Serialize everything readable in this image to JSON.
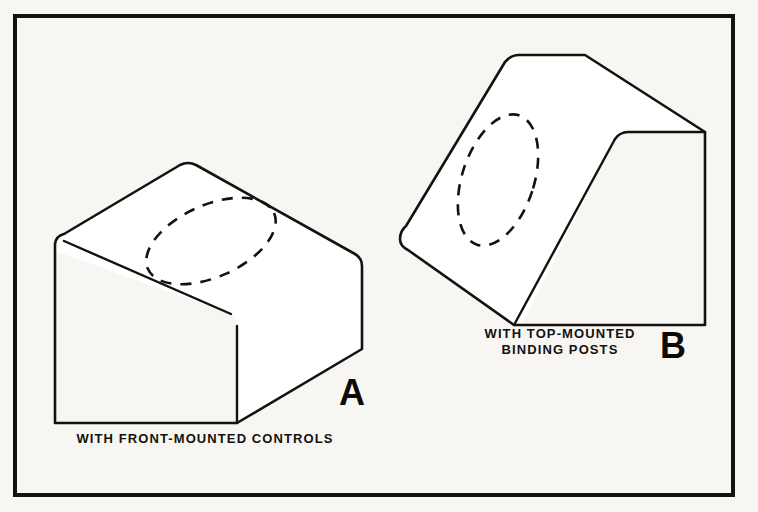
{
  "figure": {
    "background_color": "#f7f6f3",
    "ink_color": "#14120f",
    "frame": {
      "name": "illustration-border",
      "x": 13,
      "y": 14,
      "width": 722,
      "height": 483,
      "stroke_width": 4
    },
    "panels": [
      {
        "id": "A",
        "letter": "A",
        "letter_x": 352,
        "letter_y": 405,
        "letter_size": 36,
        "caption_lines": [
          "WITH FRONT-MOUNTED CONTROLS"
        ],
        "caption_x": 205,
        "caption_y": 443,
        "caption_size": 13,
        "caption_line_height": 15,
        "object_name": "chassis-box-front-mounted",
        "top_face": "M 55 251 L 55 244 Q 56 236 64 234 L 180 165 Q 188 161 196 165 L 355 254 Q 362 258 362 266 L 362 349 L 237 423 L 237 326 Q 237 318 231 314 Z",
        "outline": "M 55 251 L 55 244 Q 56 236 64 234 L 180 165 Q 188 161 196 165 L 355 254 Q 362 258 362 266 L 362 349 L 237 423 L 55 423 Z",
        "edge_top_left": "M 64 234 L 196 165",
        "edge_ridge": "M 64 241 L 231 314",
        "edge_front_right": "M 237 326 L 237 423",
        "edge_bottom": "M 55 423 L 237 423",
        "edge_left": "M 55 244 L 55 423",
        "edge_diag_lower": "M 237 423 L 362 349",
        "edge_right": "M 362 266 L 362 349",
        "edge_top_right": "M 196 165 L 355 254",
        "dashed_shape": {
          "name": "dashed-cutout-oval-a",
          "cx": 211,
          "cy": 241,
          "rx": 69,
          "ry": 36,
          "rotation": -24
        }
      },
      {
        "id": "B",
        "letter": "B",
        "letter_x": 673,
        "letter_y": 358,
        "letter_size": 36,
        "caption_lines": [
          "WITH TOP-MOUNTED",
          "BINDING POSTS"
        ],
        "caption_x": 560,
        "caption_y": 338,
        "caption_size": 13,
        "caption_line_height": 16,
        "object_name": "chassis-box-top-mounted",
        "top_face": "M 400 239 Q 400 231 406 226 L 505 62 Q 511 55 519 55 L 585 55 L 705 132 L 628 132 Q 620 132 615 139 L 525 318 Q 522 325 514 325 L 408 250 Q 400 246 400 239 Z",
        "outline": "M 400 239 Q 400 231 406 226 L 505 62 Q 511 55 519 55 L 585 55 L 705 132 L 705 325 L 525 325 Q 522 325 514 325 L 408 250 Q 400 246 400 239 Z",
        "edge_slope_left": "M 406 226 L 505 62",
        "edge_top": "M 519 55 L 585 55",
        "edge_top_diag": "M 585 55 L 705 132",
        "edge_right": "M 705 132 L 705 325",
        "edge_bottom": "M 525 325 L 705 325",
        "edge_front_slope": "M 514 325 L 615 139",
        "edge_front_corner": "M 615 139 Q 620 132 628 132 L 705 132",
        "edge_lower_left": "M 400 250 L 514 325",
        "dashed_shape": {
          "name": "dashed-cutout-oval-b",
          "cx": 498,
          "cy": 180,
          "rx": 36,
          "ry": 68,
          "rotation": 18
        }
      }
    ]
  }
}
